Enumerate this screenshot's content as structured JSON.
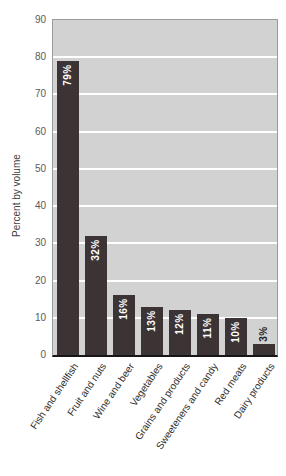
{
  "chart_data": {
    "type": "bar",
    "title": "",
    "xlabel": "",
    "ylabel": "Percent by volume",
    "categories": [
      "Fish and shellfish",
      "Fruit and nuts",
      "Wine and beer",
      "Vegetables",
      "Grains and products",
      "Sweeteners and candy",
      "Red meats",
      "Dairy products"
    ],
    "values": [
      79,
      32,
      16,
      13,
      12,
      11,
      10,
      3
    ],
    "bar_labels": [
      "79%",
      "32%",
      "16%",
      "13%",
      "12%",
      "11%",
      "10%",
      "3%"
    ],
    "ylim": [
      0,
      90
    ],
    "yticks": [
      90,
      80,
      70,
      60,
      50,
      40,
      30,
      20,
      10,
      0
    ],
    "grid": "horizontal",
    "legend": "none",
    "colors": {
      "bar": "#3c3335",
      "plot_background": "#d2d2d2",
      "gridline": "#ffffff",
      "label_inside": "#ffffff",
      "label_outside": "#1e1e1e",
      "axis_text": "#5a5a5a",
      "category_text": "#2e2e2e",
      "axis_title_text": "#3f3f3f",
      "axis_line": "#161616",
      "plot_border": "#9b9b9b"
    }
  }
}
